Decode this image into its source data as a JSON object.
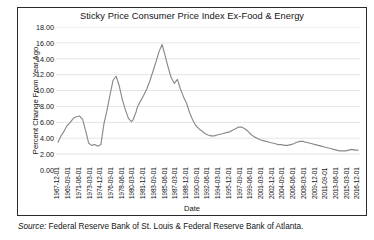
{
  "figure": {
    "title": "Sticky Price Consumer Price Index Ex-Food & Energy",
    "source": "Source:",
    "source_text": " Federal Reserve Bank of St. Louis & Federal Reserve Bank of Atlanta."
  },
  "colors": {
    "line": "#8a8a8a",
    "grid": "#d9d9d9",
    "frame": "#2b2b2b",
    "text": "#141414",
    "background": "#ffffff"
  },
  "chart_data": {
    "type": "line",
    "title": "Sticky Price Consumer Price Index Ex-Food & Energy",
    "xlabel": "Date",
    "ylabel": "Percent Change From Year Ago",
    "ylim": [
      0.0,
      18.0
    ],
    "ytick_labels": [
      "18.00",
      "16.00",
      "14.00",
      "12.00",
      "10.00",
      "8.00",
      "6.00",
      "4.00",
      "2.00",
      "0.00"
    ],
    "ytick_values": [
      18.0,
      16.0,
      14.0,
      12.0,
      10.0,
      8.0,
      6.0,
      4.0,
      2.0,
      0.0
    ],
    "grid": true,
    "legend": "none",
    "xtick_labels": [
      "1967-12-01",
      "1969-09-01",
      "1971-06-01",
      "1973-03-01",
      "1974-12-01",
      "1976-09-01",
      "1978-06-01",
      "1980-03-01",
      "1981-12-01",
      "1983-09-01",
      "1985-06-01",
      "1987-03-01",
      "1988-12-01",
      "1990-09-01",
      "1992-06-01",
      "1994-03-01",
      "1995-12-01",
      "1997-09-01",
      "1999-06-01",
      "2001-03-01",
      "2002-12-01",
      "2004-09-01",
      "2006-06-01",
      "2008-03-01",
      "2009-12-01",
      "2011-09-01",
      "2013-06-01",
      "2015-03-01",
      "2016-12-01"
    ],
    "series": [
      {
        "name": "Sticky Price CPI less Food and Energy",
        "x": [
          "1967-12-01",
          "1968-06-01",
          "1968-12-01",
          "1969-06-01",
          "1969-12-01",
          "1970-06-01",
          "1970-12-01",
          "1971-06-01",
          "1971-12-01",
          "1972-06-01",
          "1972-12-01",
          "1973-06-01",
          "1973-12-01",
          "1974-06-01",
          "1974-12-01",
          "1975-06-01",
          "1975-12-01",
          "1976-06-01",
          "1976-12-01",
          "1977-06-01",
          "1977-12-01",
          "1978-06-01",
          "1978-12-01",
          "1979-06-01",
          "1979-12-01",
          "1980-03-01",
          "1980-06-01",
          "1980-09-01",
          "1980-12-01",
          "1981-06-01",
          "1981-12-01",
          "1982-06-01",
          "1982-12-01",
          "1983-06-01",
          "1983-12-01",
          "1984-06-01",
          "1984-12-01",
          "1985-06-01",
          "1985-12-01",
          "1986-06-01",
          "1986-12-01",
          "1987-06-01",
          "1987-12-01",
          "1988-06-01",
          "1988-12-01",
          "1989-06-01",
          "1989-12-01",
          "1990-06-01",
          "1990-12-01",
          "1991-06-01",
          "1991-12-01",
          "1992-06-01",
          "1992-12-01",
          "1993-06-01",
          "1993-12-01",
          "1994-06-01",
          "1994-12-01",
          "1995-06-01",
          "1995-12-01",
          "1996-06-01",
          "1996-12-01",
          "1997-06-01",
          "1997-12-01",
          "1998-06-01",
          "1998-12-01",
          "1999-06-01",
          "1999-12-01",
          "2000-06-01",
          "2000-12-01",
          "2001-06-01",
          "2001-12-01",
          "2002-06-01",
          "2002-12-01",
          "2003-06-01",
          "2003-12-01",
          "2004-06-01",
          "2004-12-01",
          "2005-06-01",
          "2005-12-01",
          "2006-06-01",
          "2006-12-01",
          "2007-06-01",
          "2007-12-01",
          "2008-06-01",
          "2008-12-01",
          "2009-06-01",
          "2009-12-01",
          "2010-06-01",
          "2010-12-01",
          "2011-06-01",
          "2011-12-01",
          "2012-06-01",
          "2012-12-01",
          "2013-06-01",
          "2013-12-01",
          "2014-06-01",
          "2014-12-01",
          "2015-06-01",
          "2015-12-01",
          "2016-06-01",
          "2016-12-01"
        ],
        "values": [
          3.5,
          4.3,
          4.9,
          5.6,
          6.0,
          6.5,
          6.7,
          6.8,
          6.4,
          5.0,
          3.4,
          3.1,
          3.2,
          3.0,
          3.2,
          5.8,
          7.5,
          9.5,
          11.3,
          11.8,
          10.6,
          8.9,
          7.6,
          6.5,
          6.1,
          6.3,
          6.8,
          7.3,
          8.0,
          8.7,
          9.4,
          10.2,
          11.2,
          12.4,
          13.6,
          14.9,
          15.8,
          14.4,
          12.9,
          11.6,
          10.9,
          11.4,
          10.2,
          9.2,
          8.4,
          7.2,
          6.3,
          5.6,
          5.2,
          4.9,
          4.6,
          4.4,
          4.3,
          4.3,
          4.4,
          4.5,
          4.6,
          4.7,
          4.8,
          5.0,
          5.2,
          5.4,
          5.4,
          5.2,
          4.9,
          4.5,
          4.2,
          4.0,
          3.8,
          3.7,
          3.6,
          3.5,
          3.4,
          3.3,
          3.2,
          3.2,
          3.1,
          3.1,
          3.2,
          3.3,
          3.5,
          3.6,
          3.6,
          3.5,
          3.4,
          3.3,
          3.2,
          3.1,
          3.0,
          2.9,
          2.8,
          2.7,
          2.6,
          2.5,
          2.4,
          2.4,
          2.4,
          2.5,
          2.6,
          2.5,
          2.5
        ]
      }
    ]
  }
}
